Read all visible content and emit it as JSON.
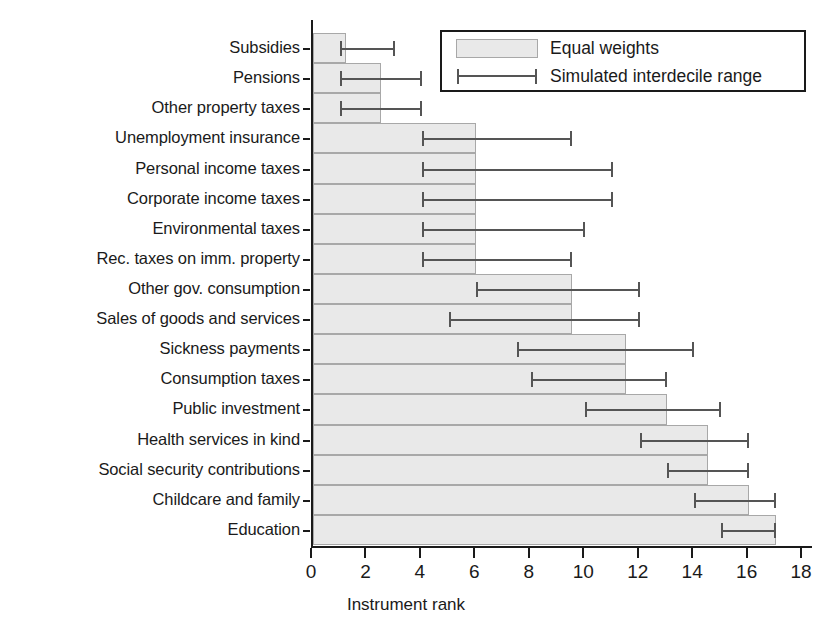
{
  "chart_data": {
    "type": "bar",
    "orientation": "horizontal",
    "title": "",
    "xlabel": "Instrument rank",
    "ylabel": "",
    "xlim": [
      0,
      18.4
    ],
    "xticks": [
      0,
      2,
      4,
      6,
      8,
      10,
      12,
      14,
      16,
      18
    ],
    "xticklabels": [
      "0",
      "2",
      "4",
      "6",
      "8",
      "10",
      "12",
      "14",
      "16",
      "18"
    ],
    "grid": false,
    "legend": {
      "position": "top-right",
      "entries": [
        {
          "label": "Equal weights",
          "marker": "filled-box",
          "color": "#e9e9e9"
        },
        {
          "label": "Simulated interdecile range",
          "marker": "error-bar",
          "color": "#555555"
        }
      ]
    },
    "categories": [
      "Subsidies",
      "Pensions",
      "Other property taxes",
      "Unemployment insurance",
      "Personal income taxes",
      "Corporate income taxes",
      "Environmental taxes",
      "Rec. taxes on imm. property",
      "Other gov. consumption",
      "Sales of goods and services",
      "Sickness payments",
      "Consumption taxes",
      "Public investment",
      "Health services in kind",
      "Social security contributions",
      "Childcare and family",
      "Education"
    ],
    "series": [
      {
        "name": "Equal weights",
        "values": [
          1.2,
          2.5,
          2.5,
          6.0,
          6.0,
          6.0,
          6.0,
          6.0,
          9.5,
          9.5,
          11.5,
          11.5,
          13.0,
          14.5,
          14.5,
          16.0,
          17.0
        ]
      }
    ],
    "error_ranges": {
      "name": "Simulated interdecile range",
      "low": [
        1.0,
        1.0,
        1.0,
        4.0,
        4.0,
        4.0,
        4.0,
        4.0,
        6.0,
        5.0,
        7.5,
        8.0,
        10.0,
        12.0,
        13.0,
        14.0,
        15.0
      ],
      "high": [
        3.0,
        4.0,
        4.0,
        9.5,
        11.0,
        11.0,
        10.0,
        9.5,
        12.0,
        12.0,
        14.0,
        13.0,
        15.0,
        16.0,
        16.0,
        17.0,
        17.0
      ]
    },
    "colors": {
      "bar_fill": "#e9e9e9",
      "bar_edge": "#a8a8a8",
      "error": "#555555",
      "axis": "#1a1a1a",
      "background": "#ffffff"
    }
  }
}
